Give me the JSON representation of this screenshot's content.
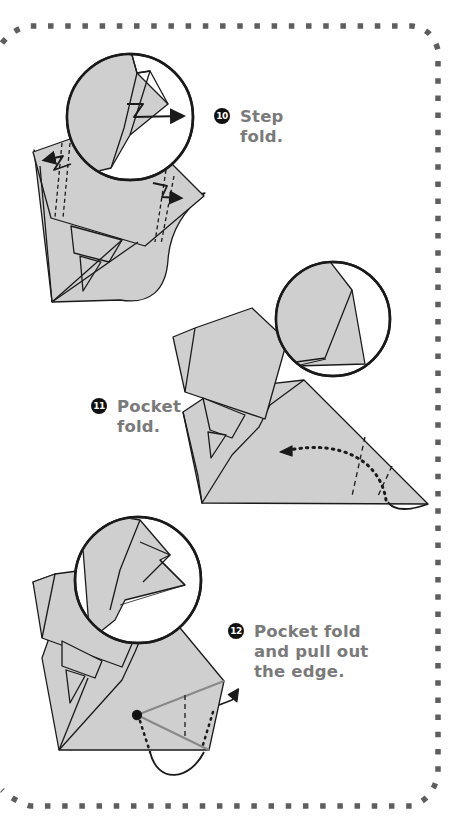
{
  "page": {
    "kind": "origami instruction page",
    "border_style": "dotted rounded frame",
    "colors": {
      "paper_fill": "#cfcfcf",
      "outline": "#1a1a1a",
      "label_text": "#7a7a7a",
      "badge_bg": "#111111",
      "badge_text": "#ffffff",
      "border_dots": "#5e5e5e",
      "background": "#ffffff"
    }
  },
  "steps": [
    {
      "number": "10",
      "lines": [
        "Step",
        "fold."
      ],
      "diagram": "step-fold with magnified circle detail and zigzag arrows"
    },
    {
      "number": "11",
      "lines": [
        "Pocket",
        "fold."
      ],
      "diagram": "pocket fold with magnified circle detail and dotted curved arrow"
    },
    {
      "number": "12",
      "lines": [
        "Pocket fold",
        "and pull out",
        "the edge."
      ],
      "diagram": "pocket fold and pull out edge with magnified circle detail and outward arrow"
    }
  ]
}
